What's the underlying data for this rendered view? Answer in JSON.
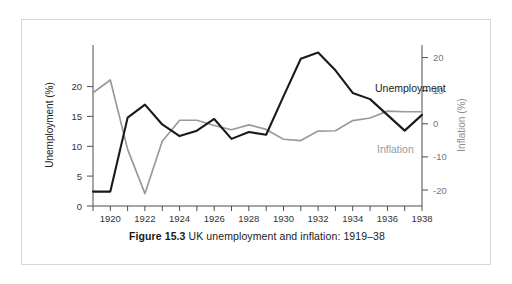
{
  "figure": {
    "caption_label": "Figure 15.3",
    "caption_text": "UK unemployment and inflation: 1919–38"
  },
  "axes": {
    "left": {
      "title": "Unemployment (%)",
      "ticks": [
        "0",
        "5",
        "10",
        "15",
        "20"
      ],
      "min": 0,
      "max": 23.5
    },
    "right": {
      "title": "Inflation (%)",
      "ticks": [
        "20",
        "10",
        "0",
        "-10",
        "-20"
      ],
      "min": -25.8,
      "max": 23.4
    },
    "bottom": {
      "ticks": [
        "1920",
        "1922",
        "1924",
        "1926",
        "1928",
        "1930",
        "1932",
        "1934",
        "1936",
        "1938"
      ],
      "min": 1919,
      "max": 1938
    }
  },
  "series_labels": {
    "unemployment": "Unemployment",
    "inflation": "Inflation"
  },
  "colors": {
    "unemployment": "#1a1a1a",
    "inflation": "#9a9a9a",
    "axis": "#4d4d4d",
    "frame": "#d7d7d7",
    "background": "#ffffff"
  },
  "chart_data": {
    "type": "line",
    "xlabel": "",
    "ylabel": "Unemployment (%)",
    "y2label": "Inflation (%)",
    "x": [
      1919,
      1920,
      1921,
      1922,
      1923,
      1924,
      1925,
      1926,
      1927,
      1928,
      1929,
      1930,
      1931,
      1932,
      1933,
      1934,
      1935,
      1936,
      1937,
      1938
    ],
    "xlim": [
      1919,
      1938
    ],
    "ylim": [
      0,
      23.5
    ],
    "y2lim": [
      -25.8,
      23.4
    ],
    "grid": false,
    "legend": "inline-annotations",
    "series": [
      {
        "name": "Unemployment",
        "axis": "left",
        "color": "#1a1a1a",
        "values": [
          2.1,
          2.1,
          12.9,
          14.8,
          11.9,
          10.2,
          11.0,
          12.7,
          9.8,
          10.8,
          10.4,
          16.0,
          21.5,
          22.4,
          19.8,
          16.5,
          15.6,
          13.3,
          11.0,
          13.3
        ]
      },
      {
        "name": "Inflation",
        "axis": "right",
        "color": "#9a9a9a",
        "values": [
          8.8,
          12.7,
          -8.5,
          -22.0,
          -6.0,
          0.4,
          0.4,
          -1.2,
          -2.5,
          -1.0,
          -2.4,
          -5.4,
          -5.8,
          -2.9,
          -2.8,
          0.3,
          1.1,
          3.2,
          3.0,
          3.0
        ]
      }
    ]
  }
}
